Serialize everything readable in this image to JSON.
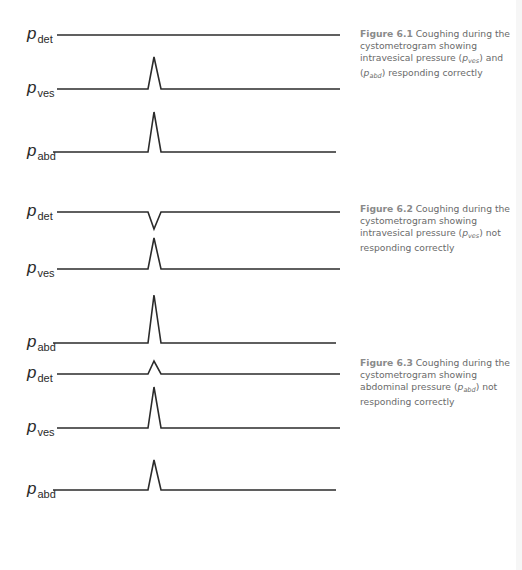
{
  "figures": [
    {
      "id": "6.1",
      "label": "Figure 6.1",
      "caption_parts": [
        "Coughing during the cystometrogram showing intravesical pressure (",
        "p",
        "ves",
        ") and (",
        "p",
        "abd",
        ") responding correctly"
      ],
      "traces": [
        {
          "name": "p",
          "sub": "det",
          "y": 35,
          "x_start": 57,
          "x_end": 340,
          "event": "none",
          "amplitude": 0
        },
        {
          "name": "p",
          "sub": "ves",
          "y": 89,
          "x_start": 57,
          "x_end": 340,
          "event": "spike",
          "amplitude": 32
        },
        {
          "name": "p",
          "sub": "abd",
          "y": 152,
          "x_start": 53,
          "x_end": 336,
          "event": "spike",
          "amplitude": 40
        }
      ]
    },
    {
      "id": "6.2",
      "label": "Figure 6.2",
      "caption_parts": [
        "Coughing during the cystometrogram showing intravesical pressure (",
        "p",
        "ves",
        ") not responding correctly"
      ],
      "traces": [
        {
          "name": "p",
          "sub": "det",
          "y": 212,
          "x_start": 57,
          "x_end": 340,
          "event": "dip",
          "amplitude": -17
        },
        {
          "name": "p",
          "sub": "ves",
          "y": 269,
          "x_start": 57,
          "x_end": 340,
          "event": "spike",
          "amplitude": 31
        },
        {
          "name": "p",
          "sub": "abd",
          "y": 343,
          "x_start": 53,
          "x_end": 336,
          "event": "spike",
          "amplitude": 48
        }
      ]
    },
    {
      "id": "6.3",
      "label": "Figure 6.3",
      "caption_parts": [
        "Coughing during the cystometrogram showing abdominal pressure (",
        "p",
        "abd",
        ") not responding correctly"
      ],
      "traces": [
        {
          "name": "p",
          "sub": "det",
          "y": 374,
          "x_start": 57,
          "x_end": 340,
          "event": "spike",
          "amplitude": 13
        },
        {
          "name": "p",
          "sub": "ves",
          "y": 428,
          "x_start": 57,
          "x_end": 340,
          "event": "spike",
          "amplitude": 41
        },
        {
          "name": "p",
          "sub": "abd",
          "y": 490,
          "x_start": 53,
          "x_end": 336,
          "event": "spike",
          "amplitude": 30
        }
      ]
    }
  ],
  "spike": {
    "x_left": 148,
    "x_peak": 154,
    "x_right": 161
  },
  "colors": {
    "trace": "#2b2b2b",
    "caption": "#6a6a6a",
    "figure_label": "#8a8a8a"
  }
}
